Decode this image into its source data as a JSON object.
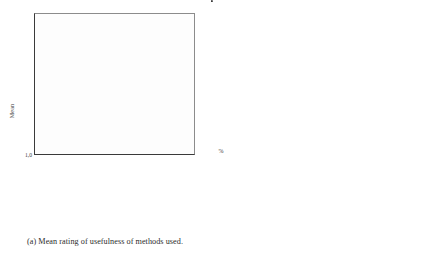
{
  "figure": {
    "panels": [
      {
        "id": "a",
        "caption": "(a) Mean rating of usefulness of methods used."
      },
      {
        "id": "b",
        "caption": "(b) Usage of methods."
      }
    ]
  },
  "chart_data": [
    {
      "type": "bar",
      "panel_label": "(a)",
      "title": "",
      "xlabel": "",
      "ylabel": "Mean",
      "ylim": [
        1.0,
        5.0
      ],
      "yticks": [
        "1,0",
        "1,5",
        "2,0",
        "2,5",
        "3,0",
        "3,5",
        "4,0",
        "4,5",
        "5,0"
      ],
      "ytick_values": [
        1.0,
        1.5,
        2.0,
        2.5,
        3.0,
        3.5,
        4.0,
        4.5,
        5.0
      ],
      "grid": false,
      "legend": "none",
      "categories": [
        "User tests",
        "Expert evaluation",
        "Heuristic evaluation",
        "Interviews",
        "Evaluation workshop",
        "Cognitive walkthrough",
        "Surveys"
      ],
      "values": [
        4.55,
        3.92,
        3.65,
        3.64,
        3.48,
        3.33,
        2.93
      ],
      "bar_color": "#2a2a2a"
    },
    {
      "type": "bar",
      "panel_label": "(b)",
      "title": "",
      "xlabel": "",
      "ylabel": "%",
      "ylim": [
        0,
        100
      ],
      "yticks": [
        "0",
        "10",
        "20",
        "30",
        "40",
        "50",
        "60",
        "70",
        "80",
        "90",
        "100"
      ],
      "ytick_values": [
        0,
        10,
        20,
        30,
        40,
        50,
        60,
        70,
        80,
        90,
        100
      ],
      "grid": false,
      "legend": "none",
      "categories": [
        "User tests",
        "Expert evaluation",
        "Heuristic evaluation",
        "Interviews",
        "Evaluation workshop",
        "Cognitive walkthrough",
        "Surveys"
      ],
      "values": [
        97,
        88,
        75,
        56,
        52,
        47,
        52
      ],
      "bar_color": "#2a2a2a"
    }
  ]
}
